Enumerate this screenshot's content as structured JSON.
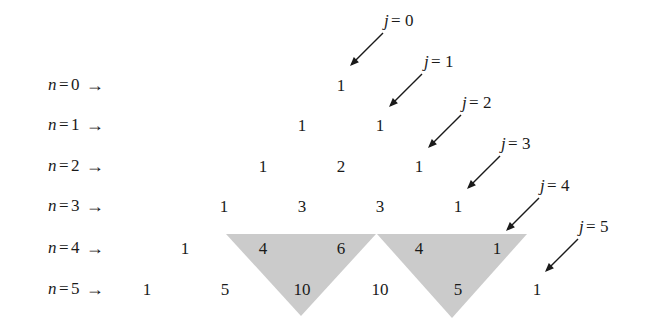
{
  "figure": {
    "background_color": "#ffffff",
    "text_color": "#1a1a1a",
    "shade_color": "#cbcbcb"
  },
  "row_labels": [
    {
      "var": "n",
      "eq": "=",
      "num": "0",
      "arrow": "→",
      "x": 48,
      "y": 85
    },
    {
      "var": "n",
      "eq": "=",
      "num": "1",
      "arrow": "→",
      "x": 48,
      "y": 125
    },
    {
      "var": "n",
      "eq": "=",
      "num": "2",
      "arrow": "→",
      "x": 48,
      "y": 166
    },
    {
      "var": "n",
      "eq": "=",
      "num": "3",
      "arrow": "→",
      "x": 48,
      "y": 206
    },
    {
      "var": "n",
      "eq": "=",
      "num": "4",
      "arrow": "→",
      "x": 48,
      "y": 248
    },
    {
      "var": "n",
      "eq": "=",
      "num": "5",
      "arrow": "→",
      "x": 48,
      "y": 289
    }
  ],
  "col_labels": [
    {
      "var": "j",
      "eq": "=",
      "num": "0",
      "x": 400,
      "y": 20
    },
    {
      "var": "j",
      "eq": "=",
      "num": "1",
      "x": 440,
      "y": 61
    },
    {
      "var": "j",
      "eq": "=",
      "num": "2",
      "x": 478,
      "y": 102
    },
    {
      "var": "j",
      "eq": "=",
      "num": "3",
      "x": 517,
      "y": 143
    },
    {
      "var": "j",
      "eq": "=",
      "num": "4",
      "x": 556,
      "y": 185
    },
    {
      "var": "j",
      "eq": "=",
      "num": "5",
      "x": 595,
      "y": 226
    }
  ],
  "arrows": [
    {
      "x1": 383,
      "y1": 33,
      "x2": 350,
      "y2": 66
    },
    {
      "x1": 422,
      "y1": 74,
      "x2": 389,
      "y2": 107
    },
    {
      "x1": 461,
      "y1": 115,
      "x2": 428,
      "y2": 148
    },
    {
      "x1": 500,
      "y1": 156,
      "x2": 467,
      "y2": 189
    },
    {
      "x1": 539,
      "y1": 198,
      "x2": 506,
      "y2": 231
    },
    {
      "x1": 578,
      "y1": 239,
      "x2": 545,
      "y2": 272
    }
  ],
  "cells": [
    {
      "value": "1",
      "n": 0,
      "j": 0,
      "x": 341,
      "y": 85
    },
    {
      "value": "1",
      "n": 1,
      "j": 0,
      "x": 302,
      "y": 125
    },
    {
      "value": "1",
      "n": 1,
      "j": 1,
      "x": 380,
      "y": 125
    },
    {
      "value": "1",
      "n": 2,
      "j": 0,
      "x": 263,
      "y": 166
    },
    {
      "value": "2",
      "n": 2,
      "j": 1,
      "x": 341,
      "y": 166
    },
    {
      "value": "1",
      "n": 2,
      "j": 2,
      "x": 419,
      "y": 166
    },
    {
      "value": "1",
      "n": 3,
      "j": 0,
      "x": 224,
      "y": 206
    },
    {
      "value": "3",
      "n": 3,
      "j": 1,
      "x": 302,
      "y": 206
    },
    {
      "value": "3",
      "n": 3,
      "j": 2,
      "x": 380,
      "y": 206
    },
    {
      "value": "1",
      "n": 3,
      "j": 3,
      "x": 458,
      "y": 206
    },
    {
      "value": "1",
      "n": 4,
      "j": 0,
      "x": 185,
      "y": 248
    },
    {
      "value": "4",
      "n": 4,
      "j": 1,
      "x": 263,
      "y": 248
    },
    {
      "value": "6",
      "n": 4,
      "j": 2,
      "x": 341,
      "y": 248
    },
    {
      "value": "4",
      "n": 4,
      "j": 3,
      "x": 419,
      "y": 248
    },
    {
      "value": "1",
      "n": 4,
      "j": 4,
      "x": 497,
      "y": 248
    },
    {
      "value": "1",
      "n": 5,
      "j": 0,
      "x": 147,
      "y": 289
    },
    {
      "value": "5",
      "n": 5,
      "j": 1,
      "x": 225,
      "y": 289
    },
    {
      "value": "10",
      "n": 5,
      "j": 2,
      "x": 302,
      "y": 289
    },
    {
      "value": "10",
      "n": 5,
      "j": 3,
      "x": 380,
      "y": 289
    },
    {
      "value": "5",
      "n": 5,
      "j": 4,
      "x": 458,
      "y": 289
    },
    {
      "value": "1",
      "n": 5,
      "j": 5,
      "x": 537,
      "y": 289
    }
  ],
  "shaded_triangles": [
    {
      "label": "left-shaded-triangle",
      "points": "226,234 376,234 301,316"
    },
    {
      "label": "right-shaded-triangle",
      "points": "377,234 527,234 452,318"
    }
  ],
  "chart_data": {
    "type": "table",
    "row_index_label": "n",
    "col_index_label": "j",
    "rows": [
      [
        1
      ],
      [
        1,
        1
      ],
      [
        1,
        2,
        1
      ],
      [
        1,
        3,
        3,
        1
      ],
      [
        1,
        4,
        6,
        4,
        1
      ],
      [
        1,
        5,
        10,
        10,
        5,
        1
      ]
    ],
    "row_labels": [
      "n = 0",
      "n = 1",
      "n = 2",
      "n = 3",
      "n = 4",
      "n = 5"
    ],
    "col_labels": [
      "j = 0",
      "j = 1",
      "j = 2",
      "j = 3",
      "j = 4",
      "j = 5"
    ],
    "annotations": [
      "Downward-pointing shaded triangle covering C(4,1)=4, C(4,2)=6 and C(5,2)=10",
      "Downward-pointing shaded triangle covering C(4,3)=4, C(4,4)=1 and C(5,4)=5"
    ]
  }
}
